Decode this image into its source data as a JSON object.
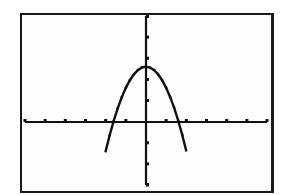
{
  "chart_data": {
    "type": "line",
    "title": "",
    "xlabel": "",
    "ylabel": "",
    "xlim": [
      -6,
      6
    ],
    "ylim": [
      -3,
      5
    ],
    "xscl": 1,
    "yscl": 1,
    "grid": false,
    "legend": null,
    "series": [
      {
        "name": "parabola",
        "equation": "y = -x^2 + 2.6",
        "x": [
          -2.0,
          -1.8,
          -1.6,
          -1.4,
          -1.2,
          -1.0,
          -0.8,
          -0.6,
          -0.4,
          -0.2,
          0.0,
          0.2,
          0.4,
          0.6,
          0.8,
          1.0,
          1.2,
          1.4,
          1.6,
          1.8,
          2.0
        ],
        "y": [
          -1.4,
          -0.64,
          0.04,
          0.64,
          1.16,
          1.6,
          1.96,
          2.24,
          2.44,
          2.56,
          2.6,
          2.56,
          2.44,
          2.24,
          1.96,
          1.6,
          1.16,
          0.64,
          0.04,
          -0.64,
          -1.4
        ]
      }
    ],
    "x_ticks": [
      -6,
      -5,
      -4,
      -3,
      -2,
      -1,
      1,
      2,
      3,
      4,
      5,
      6
    ],
    "y_ticks": [
      -3,
      -2,
      -1,
      1,
      2,
      3,
      4,
      5
    ]
  },
  "screen": {
    "description": "Graphing calculator window showing a downward-opening parabola"
  }
}
